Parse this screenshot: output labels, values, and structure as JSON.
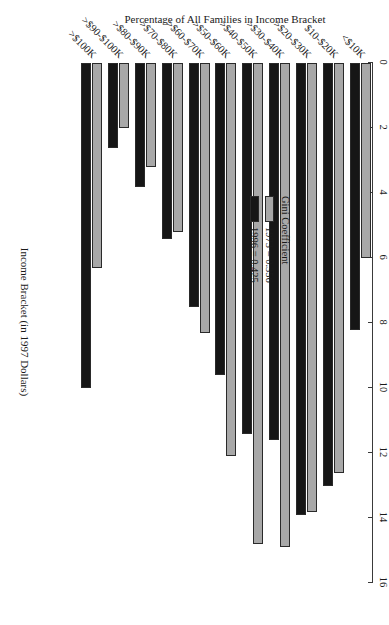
{
  "chart_data": {
    "type": "bar",
    "title": "",
    "xlabel": "Income Bracket (in 1997 Dollars)",
    "ylabel": "Percentage of All Families in Income Bracket",
    "ylim": [
      0,
      16
    ],
    "yticks": [
      "0",
      "2",
      "4",
      "6",
      "8",
      "10",
      "12",
      "14",
      "16"
    ],
    "ytick_values": [
      0,
      2,
      4,
      6,
      8,
      10,
      12,
      14,
      16
    ],
    "grid": false,
    "legend_position": "upper-center-left",
    "orientation": "vertical-bars-rotated-page",
    "categories": [
      "<$10K",
      "$10-$20K",
      ">$20-$30K",
      ">$30-$40K",
      ">$40-$50K",
      ">$50-$60K",
      ">$60-$70K",
      ">$70-$80K",
      ">$80-$90K",
      ">$90-$100K",
      ">$100K"
    ],
    "series": [
      {
        "name": "1973 = 0.356",
        "color": "#a8a8a8",
        "values": [
          6.0,
          12.6,
          13.8,
          14.9,
          14.8,
          12.1,
          8.3,
          5.2,
          3.2,
          2.0,
          6.3
        ]
      },
      {
        "name": "1996 = 0.425",
        "color": "#161616",
        "values": [
          8.2,
          13.0,
          13.9,
          11.6,
          11.4,
          9.6,
          7.5,
          5.4,
          3.8,
          2.6,
          10.0
        ]
      }
    ]
  },
  "legend": {
    "title": "Gini Coefficient",
    "entries": [
      {
        "label": "1973 = 0.356",
        "color": "#a8a8a8"
      },
      {
        "label": "1996 = 0.425",
        "color": "#161616"
      }
    ]
  },
  "axes": {
    "value_axis_title": "Percentage of All Families in Income Bracket",
    "category_axis_title": "Income Bracket (in 1997 Dollars)"
  }
}
